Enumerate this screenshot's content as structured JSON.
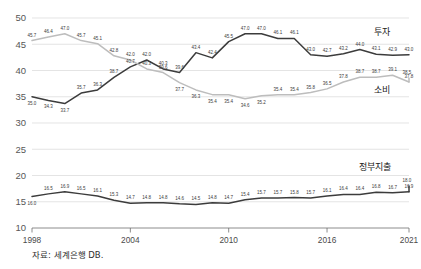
{
  "source_note": "자료: 세계은행 DB.",
  "chart_data": {
    "type": "line",
    "title": "",
    "subtitle": "",
    "xlabel": "",
    "ylabel": "",
    "xlim": [
      1998,
      2021
    ],
    "ylim": [
      10,
      50
    ],
    "yticks": [
      10,
      15,
      20,
      25,
      30,
      35,
      40,
      45,
      50
    ],
    "ytick_labels": [
      "10",
      "15",
      "20",
      "25",
      "30",
      "35",
      "40",
      "45",
      "50"
    ],
    "xticks": [
      1998,
      2004,
      2010,
      2016,
      2021
    ],
    "xtick_labels": [
      "1998",
      "2004",
      "2010",
      "2016",
      "2021"
    ],
    "grid": "horizontal",
    "legend_position": "inline-right",
    "x": [
      1998,
      1999,
      2000,
      2001,
      2002,
      2003,
      2004,
      2005,
      2006,
      2007,
      2008,
      2009,
      2010,
      2011,
      2012,
      2013,
      2014,
      2015,
      2016,
      2017,
      2018,
      2019,
      2020,
      2021
    ],
    "series": [
      {
        "name": "투자",
        "label": "투자",
        "color": "#3c3c3c",
        "values": [
          35.0,
          34.3,
          33.7,
          35.7,
          36.3,
          38.7,
          40.7,
          42.0,
          40.3,
          39.6,
          43.4,
          42.4,
          45.5,
          47.0,
          47.0,
          46.1,
          46.1,
          43.0,
          42.7,
          43.2,
          44.0,
          43.1,
          42.9,
          43.0
        ],
        "labels": [
          "35.0",
          "34.3",
          "33.7",
          "35.7",
          "36.3",
          "38.7",
          "40.7",
          "42.0",
          "40.3",
          "39.6",
          "43.4",
          "42.4",
          "45.5",
          "47.0",
          "47.0",
          "46.1",
          "46.1",
          "43.0",
          "42.7",
          "43.2",
          "44.0",
          "43.1",
          "42.9",
          "43.0"
        ]
      },
      {
        "name": "소비",
        "label": "소비",
        "color": "#bdbdbd",
        "values": [
          45.7,
          46.4,
          47.0,
          45.7,
          45.1,
          42.8,
          42.0,
          40.3,
          39.6,
          37.7,
          36.3,
          35.4,
          35.4,
          34.6,
          35.2,
          35.4,
          35.4,
          35.8,
          36.5,
          37.8,
          38.7,
          38.7,
          39.1,
          37.8
        ],
        "labels": [
          "45.7",
          "46.4",
          "47.0",
          "45.7",
          "45.1",
          "42.8",
          "42.0",
          "40.3",
          "39.6",
          "37.7",
          "36.3",
          "35.4",
          "35.4",
          "34.6",
          "35.2",
          "35.4",
          "35.4",
          "35.8",
          "36.5",
          "37.8",
          "38.7",
          "38.7",
          "39.1",
          "37.8"
        ],
        "extra_label": "38.5"
      },
      {
        "name": "정부지출",
        "label": "정부지출",
        "color": "#3c3c3c",
        "values": [
          16.0,
          16.5,
          16.9,
          16.5,
          16.1,
          15.3,
          14.7,
          14.8,
          14.8,
          14.6,
          14.5,
          14.8,
          14.7,
          15.4,
          15.7,
          15.7,
          15.8,
          15.7,
          16.1,
          16.4,
          16.4,
          16.8,
          16.7,
          16.9
        ],
        "labels": [
          "16.0",
          "16.5",
          "16.9",
          "16.5",
          "16.1",
          "15.3",
          "14.7",
          "14.8",
          "14.8",
          "14.6",
          "14.5",
          "14.8",
          "14.7",
          "15.4",
          "15.7",
          "15.7",
          "15.8",
          "15.7",
          "16.1",
          "16.4",
          "16.4",
          "16.8",
          "16.7",
          "16.9"
        ],
        "extra_label": "18.0"
      }
    ]
  }
}
